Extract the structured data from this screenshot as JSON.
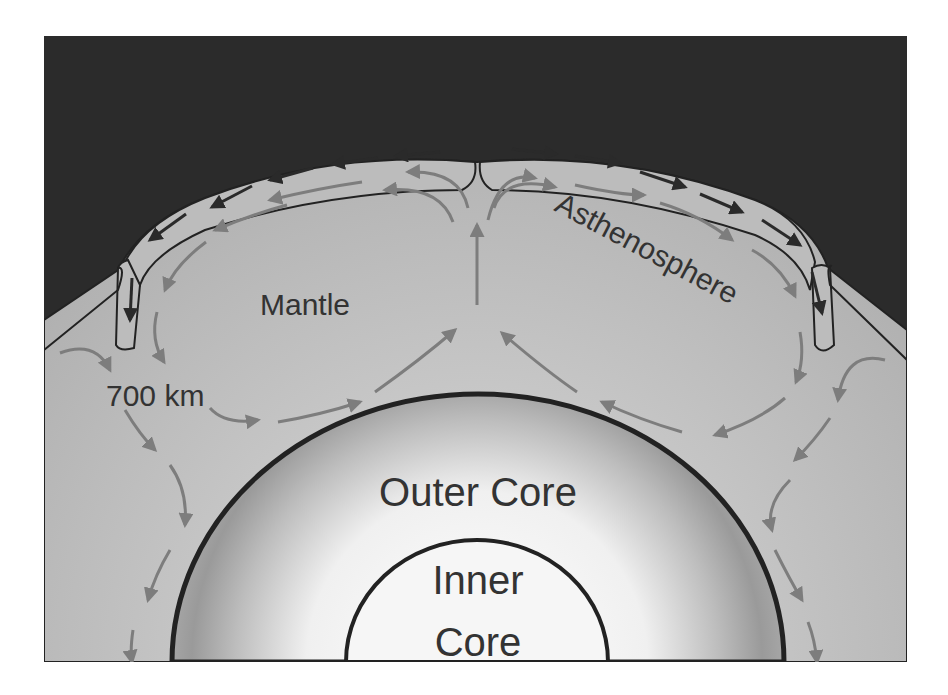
{
  "figure": {
    "labels": {
      "mantle": "Mantle",
      "asthenosphere": "Asthenosphere",
      "depth": "700 km",
      "outer_core": "Outer Core",
      "inner_core_line1": "Inner",
      "inner_core_line2": "Core"
    },
    "colors": {
      "space": "#2b2b2b",
      "mantle": "#b5b5b5",
      "lithosphere": "#b8b8b8",
      "outline": "#222222",
      "outer_core_light": "#f2f2f2",
      "outer_core_dark": "#8f8f8f",
      "inner_core": "#f6f6f6",
      "convection_arrow": "#7d7d7d",
      "plate_arrow": "#2a2a2a",
      "text": "#333333"
    }
  }
}
